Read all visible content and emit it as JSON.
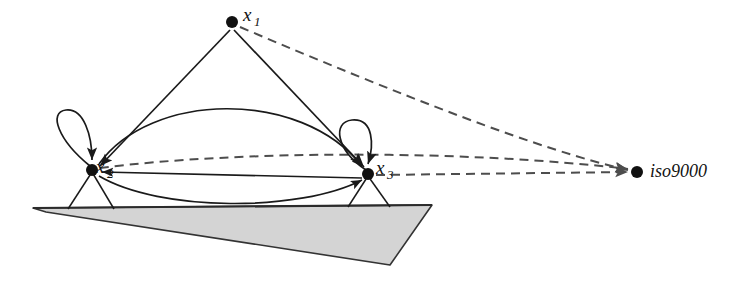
{
  "diagram": {
    "background_color": "#ffffff",
    "stroke_color": "#1a1a1a",
    "ground_fill_color": "#d4d4d4",
    "ground_stroke_color": "#333333",
    "dashed_color": "#4d4d4d",
    "nodes": [
      {
        "id": "x1",
        "label_base": "x",
        "label_sub": "1",
        "label_full": "x1",
        "cx": 232,
        "cy": 22,
        "r": 6,
        "label_x": 243,
        "label_y": 21,
        "has_self_loop": false,
        "has_legs": false
      },
      {
        "id": "x2",
        "label_base": "x",
        "label_sub": "2",
        "label_full": "x2",
        "cx": 92,
        "cy": 170,
        "r": 6,
        "label_x": 96,
        "label_y": 173,
        "has_self_loop": true,
        "has_legs": true
      },
      {
        "id": "x3",
        "label_base": "x",
        "label_sub": "3",
        "label_full": "x3",
        "cx": 368,
        "cy": 174,
        "r": 6,
        "label_x": 376,
        "label_y": 174,
        "has_self_loop": true,
        "has_legs": true
      }
    ],
    "external_node": {
      "id": "iso9000",
      "label": "iso9000",
      "cx": 637,
      "cy": 172,
      "r": 6,
      "label_x": 650,
      "label_y": 176
    },
    "solid_edges": [
      {
        "name": "x1-to-x2",
        "from": "x1",
        "to": "x2"
      },
      {
        "name": "x1-to-x3",
        "from": "x1",
        "to": "x3"
      },
      {
        "name": "x2-to-x3-upper-arc",
        "from": "x2",
        "to": "x3"
      },
      {
        "name": "x2-to-x3-lower-arc",
        "from": "x2",
        "to": "x3"
      },
      {
        "name": "x3-to-x2-straight",
        "from": "x3",
        "to": "x2"
      }
    ],
    "dashed_edges": [
      {
        "name": "x1-to-iso9000",
        "from": "x1",
        "to": "iso9000"
      },
      {
        "name": "x2-to-iso9000",
        "from": "x2",
        "to": "iso9000"
      },
      {
        "name": "x3-to-iso9000",
        "from": "x3",
        "to": "iso9000"
      }
    ],
    "self_loops": [
      {
        "name": "x2-self-loop",
        "node": "x2"
      },
      {
        "name": "x3-self-loop",
        "node": "x3"
      }
    ],
    "ground_plane": {
      "name": "ground-plane",
      "points": "33,208 432,205 390,265 46,212"
    }
  }
}
